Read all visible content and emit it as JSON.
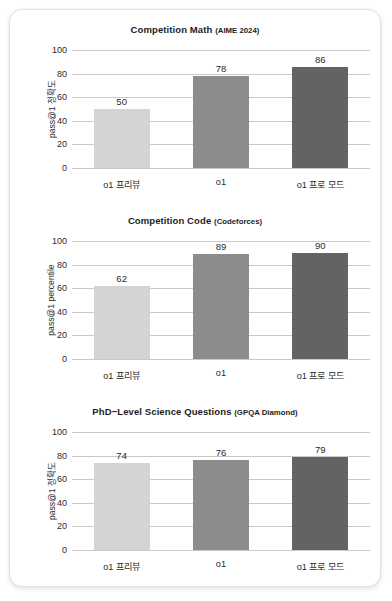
{
  "card": {
    "background": "#ffffff",
    "border_color": "#e2e2e2"
  },
  "series_colors": {
    "o1_preview": "#d4d4d4",
    "o1": "#8c8c8c",
    "o1_pro_mode": "#636363"
  },
  "chart_data": [
    {
      "type": "bar",
      "title": "Competition Math",
      "title_sub": "(AIME 2024)",
      "categories": [
        "o1 프리뷰",
        "o1",
        "o1 프로 모드"
      ],
      "values": [
        50,
        78,
        86
      ],
      "value_labels": [
        "50",
        "78",
        "86"
      ],
      "xlabel": "",
      "ylabel": "pass@1 정확도",
      "ylim": [
        0,
        100
      ],
      "yticks": [
        100,
        80,
        60,
        40,
        20,
        0
      ],
      "ytick_labels": [
        "100",
        "80",
        "60",
        "40",
        "20",
        "0"
      ],
      "grid": true,
      "legend": "none",
      "bar_colors": [
        "#d4d4d4",
        "#8c8c8c",
        "#636363"
      ]
    },
    {
      "type": "bar",
      "title": "Competition Code",
      "title_sub": "(Codeforces)",
      "categories": [
        "o1 프리뷰",
        "o1",
        "o1 프로 모드"
      ],
      "values": [
        62,
        89,
        90
      ],
      "value_labels": [
        "62",
        "89",
        "90"
      ],
      "xlabel": "",
      "ylabel": "pass@1 percentile",
      "ylim": [
        0,
        100
      ],
      "yticks": [
        100,
        80,
        60,
        40,
        20,
        0
      ],
      "ytick_labels": [
        "100",
        "80",
        "60",
        "40",
        "20",
        "0"
      ],
      "grid": true,
      "legend": "none",
      "bar_colors": [
        "#d4d4d4",
        "#8c8c8c",
        "#636363"
      ]
    },
    {
      "type": "bar",
      "title": "PhD−Level Science Questions",
      "title_sub": "(GPQA Diamond)",
      "categories": [
        "o1 프리뷰",
        "o1",
        "o1 프로 모드"
      ],
      "values": [
        74,
        76,
        79
      ],
      "value_labels": [
        "74",
        "76",
        "79"
      ],
      "xlabel": "",
      "ylabel": "pass@1 정확도",
      "ylim": [
        0,
        100
      ],
      "yticks": [
        100,
        80,
        60,
        40,
        20,
        0
      ],
      "ytick_labels": [
        "100",
        "80",
        "60",
        "40",
        "20",
        "0"
      ],
      "grid": true,
      "legend": "none",
      "bar_colors": [
        "#d4d4d4",
        "#8c8c8c",
        "#636363"
      ]
    }
  ]
}
